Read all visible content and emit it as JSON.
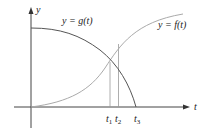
{
  "diagram": {
    "type": "function-graph",
    "axes": {
      "x_label": "t",
      "y_label": "y"
    },
    "curves": [
      {
        "name": "g",
        "label": "y = g(t)",
        "shape": "decreasing concave-down",
        "color": "#555555"
      },
      {
        "name": "f",
        "label": "y = f(t)",
        "shape": "increasing, sigmoid-like",
        "color": "#aaaaaa"
      }
    ],
    "ticks": [
      {
        "label": "t",
        "sub": "1",
        "note": "intersection of f and g"
      },
      {
        "label": "t",
        "sub": "2",
        "note": "vertical line"
      },
      {
        "label": "t",
        "sub": "3",
        "note": "g(t) = 0"
      }
    ],
    "colors": {
      "axis": "#444444",
      "g_curve": "#555555",
      "f_curve": "#aaaaaa",
      "guide": "#999999"
    }
  },
  "labels": {
    "y_axis": "y",
    "t_axis": "t",
    "g_label": "y = g(t)",
    "f_label": "y = f(t)",
    "t1": "t",
    "t1_sub": "1",
    "t2": "t",
    "t2_sub": "2",
    "t3": "t",
    "t3_sub": "3"
  }
}
